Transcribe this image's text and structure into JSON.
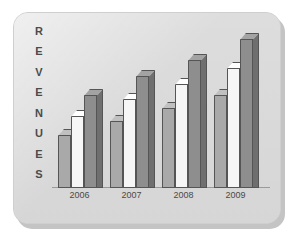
{
  "card": {
    "background_color": "#dcdcdc",
    "border_color": "#cfcfcf"
  },
  "axis_label": {
    "text": "REVENUES",
    "letters": [
      "R",
      "E",
      "V",
      "E",
      "N",
      "U",
      "E",
      "S"
    ],
    "color": "#4b4b4b",
    "orientation": "vertical-stacked"
  },
  "chart_data": {
    "type": "bar",
    "title": "",
    "subtitle": "",
    "xlabel": "",
    "ylabel": "REVENUES",
    "categories": [
      "2006",
      "2007",
      "2008",
      "2009"
    ],
    "series": [
      {
        "name": "Bar 1",
        "color": "#a9a9a9",
        "values": [
          40,
          50,
          60,
          70
        ]
      },
      {
        "name": "Bar 2",
        "color": "#f6f6f6",
        "values": [
          54,
          67,
          78,
          90
        ]
      },
      {
        "name": "Bar 3",
        "color": "#8e8e8e",
        "values": [
          70,
          84,
          96,
          112
        ]
      }
    ],
    "ylim": [
      0,
      120
    ],
    "grid": false,
    "legend": "none",
    "style": "3d-grouped-bars",
    "tick_labels_x": [
      "2006",
      "2007",
      "2008",
      "2009"
    ],
    "tick_labels_y": []
  }
}
